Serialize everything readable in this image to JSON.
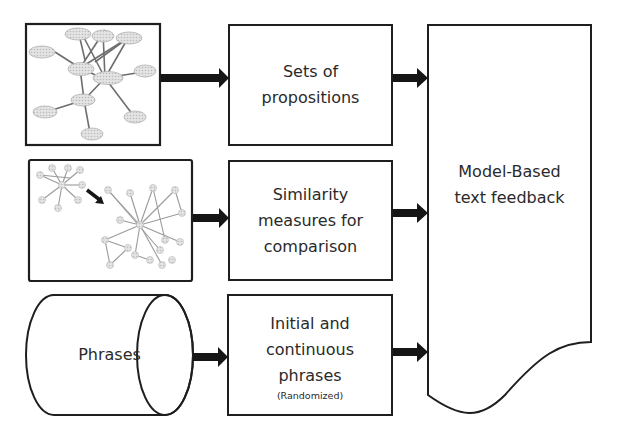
{
  "diagram": {
    "row1": {
      "source": {
        "type": "concept-map-image"
      },
      "process": {
        "lines": [
          "Sets of",
          "propositions"
        ]
      }
    },
    "row2": {
      "source": {
        "type": "graph-comparison-image"
      },
      "process": {
        "lines": [
          "Similarity",
          "measures for",
          "comparison"
        ]
      }
    },
    "row3": {
      "source": {
        "type": "database-cylinder",
        "label": "Phrases"
      },
      "process": {
        "lines": [
          "Initial and",
          "continuous",
          "phrases"
        ],
        "note": "(Randomized)"
      }
    },
    "output": {
      "type": "document",
      "lines": [
        "Model-Based",
        "text feedback"
      ]
    },
    "colors": {
      "stroke": "#1e1e1e",
      "arrow": "#161616",
      "node_fill": "#d9d9d9",
      "node_stroke": "#b5b5b5",
      "edge": "#7a7a7a",
      "text": "#2a2a2a"
    }
  }
}
